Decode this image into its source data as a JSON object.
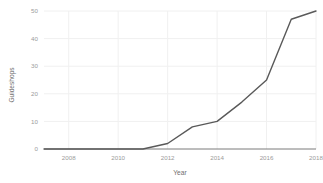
{
  "chart_data": {
    "type": "line",
    "title": "",
    "xlabel": "Year",
    "ylabel": "Guideshops",
    "x": [
      2007,
      2008,
      2009,
      2010,
      2011,
      2012,
      2013,
      2014,
      2015,
      2016,
      2017,
      2018
    ],
    "values": [
      0,
      0,
      0,
      0,
      0,
      2,
      8,
      10,
      17,
      25,
      47,
      50
    ],
    "series": [
      {
        "name": "Guideshops",
        "values": [
          0,
          0,
          0,
          0,
          0,
          2,
          8,
          10,
          17,
          25,
          47,
          50
        ]
      }
    ],
    "xticks": [
      2008,
      2010,
      2012,
      2014,
      2016,
      2018
    ],
    "xtick_labels": [
      "2008",
      "2010",
      "2012",
      "2014",
      "2016",
      "2018"
    ],
    "yticks": [
      0,
      10,
      20,
      30,
      40,
      50
    ],
    "ytick_labels": [
      "0",
      "10",
      "20",
      "30",
      "40",
      "50"
    ],
    "xlim": [
      2007,
      2018
    ],
    "ylim": [
      0,
      50
    ],
    "grid": true,
    "legend": "none",
    "line_color": "#595959",
    "grid_color": "#f0f0f0",
    "axis_color": "#7a7a7a",
    "background_color": "#ffffff"
  }
}
